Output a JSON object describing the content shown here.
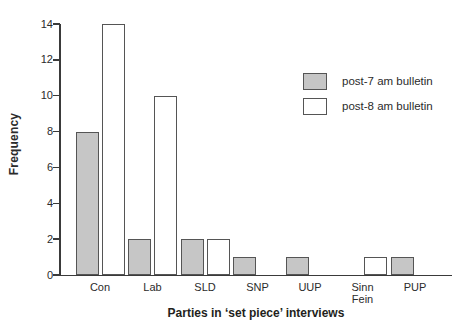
{
  "chart_data": {
    "type": "bar",
    "title": "",
    "xlabel": "Parties in ‘set piece’ interviews",
    "ylabel": "Frequency",
    "categories": [
      "Con",
      "Lab",
      "SLD",
      "SNP",
      "UUP",
      "Sinn Fein",
      "PUP"
    ],
    "series": [
      {
        "name": "post-7 am bulletin",
        "color": "#c6c6c6",
        "values": [
          8,
          2,
          2,
          1,
          1,
          0,
          1
        ]
      },
      {
        "name": "post-8 am bulletin",
        "color": "#ffffff",
        "values": [
          14,
          10,
          2,
          0,
          0,
          1,
          0
        ]
      }
    ],
    "ylim": [
      0,
      14
    ],
    "yticks": [
      0,
      2,
      4,
      6,
      8,
      10,
      12,
      14
    ],
    "grid": false,
    "legend_position": "upper-right-inside"
  },
  "legend": {
    "items": [
      {
        "label": "post-7 am bulletin",
        "swatch_color": "#c6c6c6"
      },
      {
        "label": "post-8 am bulletin",
        "swatch_color": "#ffffff"
      }
    ]
  },
  "colors": {
    "bar_gray_fill": "#c6c6c6",
    "bar_white_fill": "#ffffff",
    "bar_border": "#555555",
    "axis_line": "#3a3a3a",
    "text": "#2b2b2b",
    "background": "#ffffff"
  }
}
